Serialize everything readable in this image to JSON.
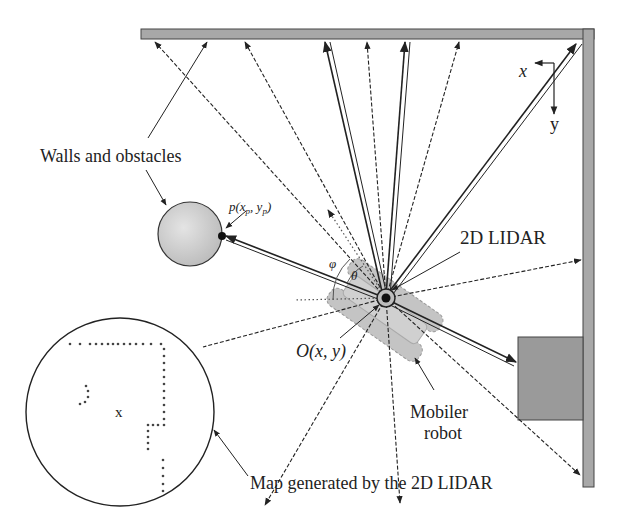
{
  "labels": {
    "walls_obstacles": "Walls and obstacles",
    "point_p": "p(x",
    "point_p_sub": "p",
    "point_p_mid": ", y",
    "point_p_sub2": "p",
    "point_p_end": ")",
    "lidar": "2D LIDAR",
    "origin": "O(x, y)",
    "robot_line1": "Mobiler",
    "robot_line2": "robot",
    "map_caption": "Map generated by the 2D LIDAR",
    "phi": "φ",
    "theta": "θ",
    "axis_x": "x",
    "axis_y": "y",
    "map_robot_marker": "x"
  },
  "colors": {
    "wall_fill": "#a8a8a8",
    "wall_stroke": "#444444",
    "obstacle_box": "#9a9a9a",
    "obstacle_circle": "#d4d4d4",
    "robot_body": "#c8c8c8",
    "line": "#222222"
  }
}
